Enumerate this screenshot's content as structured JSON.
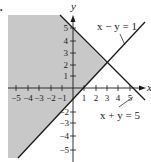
{
  "figure": {
    "marker": "•",
    "axes": {
      "x_label": "x",
      "y_label": "y",
      "x_ticks": [
        {
          "value": -5,
          "label": "−5"
        },
        {
          "value": -4,
          "label": "−4"
        },
        {
          "value": -3,
          "label": "−3"
        },
        {
          "value": -2,
          "label": "−2"
        },
        {
          "value": -1,
          "label": "−1"
        },
        {
          "value": 1,
          "label": "1"
        },
        {
          "value": 2,
          "label": "2"
        },
        {
          "value": 3,
          "label": "3"
        },
        {
          "value": 4,
          "label": "4"
        },
        {
          "value": 5,
          "label": "5"
        }
      ],
      "y_ticks": [
        {
          "value": 5,
          "label": "5"
        },
        {
          "value": 4,
          "label": "4"
        },
        {
          "value": 3,
          "label": "3"
        },
        {
          "value": 2,
          "label": "2"
        },
        {
          "value": 1,
          "label": "1"
        },
        {
          "value": -2,
          "label": "−2"
        },
        {
          "value": -3,
          "label": "−3"
        },
        {
          "value": -4,
          "label": "−4"
        },
        {
          "value": -5,
          "label": "−5"
        }
      ]
    },
    "lines": [
      {
        "equation": "x − y = 1",
        "label": "x − y = 1"
      },
      {
        "equation": "x + y = 5",
        "label": "x + y = 5"
      }
    ],
    "intersection": {
      "x": 3,
      "y": 2
    },
    "shaded_region": "x + y ≤ 5 and x − y ≤ 1",
    "colors": {
      "shade": "#c8c8c8",
      "line": "#1a1a1a",
      "background": "#ffffff"
    }
  }
}
